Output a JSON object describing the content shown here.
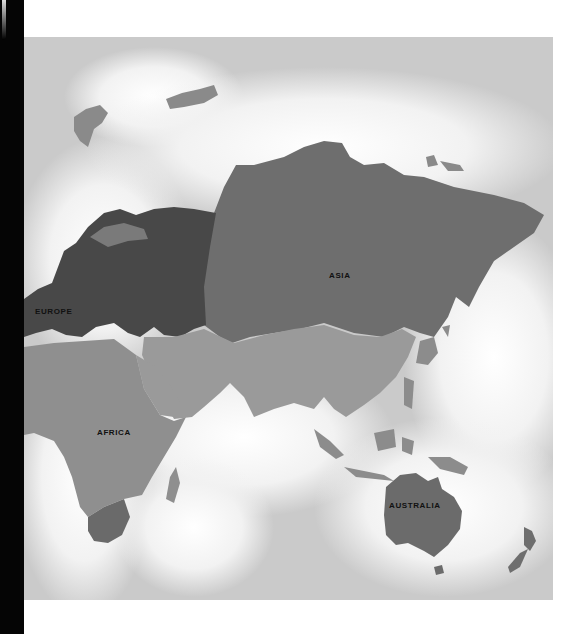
{
  "map": {
    "title": "Eastern Hemisphere continents",
    "colors": {
      "ocean": "#cfcfcf",
      "ocean_glow": "#ffffff",
      "europe": "#4a4a4a",
      "asia_north": "#6e6e6e",
      "asia_south": "#9a9a9a",
      "africa": "#8f8f8f",
      "south_africa": "#6a6a6a",
      "australia": "#6b6b6b",
      "islands": "#7a7a7a"
    },
    "labels": {
      "europe": "EUROPE",
      "asia": "ASIA",
      "africa": "AFRICA",
      "australia": "AUSTRALIA"
    }
  }
}
